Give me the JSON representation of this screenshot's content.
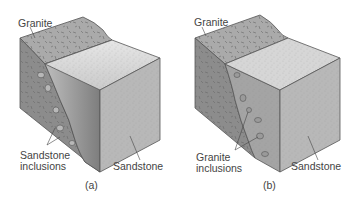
{
  "figure": {
    "panels": [
      {
        "id": "a",
        "caption": "(a)",
        "labels": {
          "top": "Granite",
          "inclusions_line1": "Sandstone",
          "inclusions_line2": "inclusions",
          "block": "Sandstone"
        },
        "colors": {
          "granite_top": "#a9a9a9",
          "granite_side": "#8a8a8a",
          "sandstone_top": "#cfcfcf",
          "sandstone_front": "#b4b4b4",
          "fault_face": "#9a9a9a",
          "outline": "#555555"
        }
      },
      {
        "id": "b",
        "caption": "(b)",
        "labels": {
          "top": "Granite",
          "inclusions_line1": "Granite",
          "inclusions_line2": "inclusions",
          "block": "Sandstone"
        },
        "colors": {
          "granite_top": "#a9a9a9",
          "granite_side": "#8a8a8a",
          "sandstone_top": "#d2d2d2",
          "sandstone_front": "#b6b6b6",
          "sandstone_side": "#a2a2a2",
          "outline": "#555555"
        }
      }
    ]
  }
}
